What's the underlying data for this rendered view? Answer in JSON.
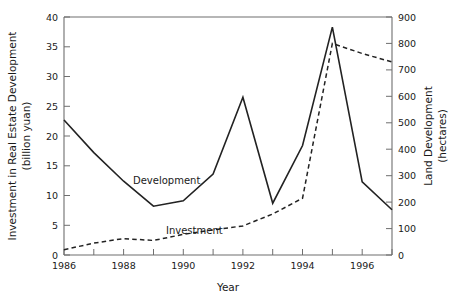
{
  "chart_data": {
    "type": "line",
    "title": "",
    "xlabel": "Year",
    "ylabel": "Investment in Real Estate Development (billion yuan)",
    "y2label": "Land Development (hectares)",
    "x": [
      1986,
      1987,
      1988,
      1989,
      1990,
      1991,
      1992,
      1993,
      1994,
      1995,
      1996,
      1997
    ],
    "xlim": [
      1986,
      1997
    ],
    "ylim": [
      0,
      40
    ],
    "y2lim": [
      0,
      900
    ],
    "grid": false,
    "legend_position": "inline-annotations",
    "series": [
      {
        "name": "Development",
        "axis": "left",
        "style": "solid",
        "units": "billion yuan",
        "values": [
          22.7,
          17.2,
          12.4,
          8.2,
          9.1,
          13.6,
          26.5,
          8.7,
          18.4,
          38.3,
          12.3,
          7.6
        ]
      },
      {
        "name": "Investment",
        "axis": "right",
        "style": "dashed",
        "units": "hectares",
        "values": [
          20,
          45,
          62,
          55,
          78,
          95,
          110,
          155,
          215,
          800,
          762,
          730
        ]
      }
    ],
    "y_ticks": [
      0,
      5,
      10,
      15,
      20,
      25,
      30,
      35,
      40
    ],
    "y2_ticks": [
      0,
      100,
      200,
      300,
      400,
      500,
      600,
      700,
      800,
      900
    ],
    "x_ticks_major": [
      1986,
      1988,
      1990,
      1992,
      1994,
      1996
    ],
    "x_ticks_minor": [
      1987,
      1989,
      1991,
      1993,
      1995,
      1997
    ],
    "annotations": [
      {
        "name": "Development",
        "text": "Development"
      },
      {
        "name": "Investment",
        "text": "Investment"
      }
    ],
    "colors": {
      "line": "#222222",
      "axis": "#6e6e6e",
      "text": "#1a1a1a",
      "background": "#ffffff"
    }
  },
  "axes": {
    "left_title_line1": "Investment in Real Estate Development",
    "left_title_line2": "(billion yuan)",
    "right_title_line1": "Land Development",
    "right_title_line2": "(hectares)",
    "x_title": "Year"
  },
  "labels": {
    "series_development": "Development",
    "series_investment": "Investment"
  },
  "ticks": {
    "y0": "0",
    "y5": "5",
    "y10": "10",
    "y15": "15",
    "y20": "20",
    "y25": "25",
    "y30": "30",
    "y35": "35",
    "y40": "40",
    "r0": "0",
    "r100": "100",
    "r200": "200",
    "r300": "300",
    "r400": "400",
    "r500": "500",
    "r600": "600",
    "r700": "700",
    "r800": "800",
    "r900": "900",
    "x1986": "1986",
    "x1988": "1988",
    "x1990": "1990",
    "x1992": "1992",
    "x1994": "1994",
    "x1996": "1996"
  }
}
